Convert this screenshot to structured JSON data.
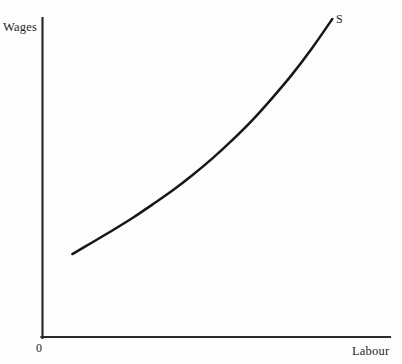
{
  "figure": {
    "background_color": "#fdfdfd",
    "ink_color": "#1a1a1a",
    "axis_color": "#2b2b2b"
  },
  "labels": {
    "y_axis_title": "Wages",
    "x_axis_title": "Labour",
    "origin": "0",
    "curve": "S"
  },
  "chart_data": {
    "type": "line",
    "title": "",
    "subtitle": "",
    "xlabel": "Labour",
    "ylabel": "Wages",
    "annotations": [
      {
        "text": "S",
        "meaning": "labour supply curve",
        "position": "upper-right end of curve"
      },
      {
        "text": "0",
        "meaning": "origin",
        "position": "below intersection of axes"
      }
    ],
    "grid": false,
    "legend": null,
    "axis_ticks": {
      "x": [],
      "y": []
    },
    "axis_arrows": false,
    "xlim": [
      0,
      1
    ],
    "ylim": [
      0,
      1
    ],
    "series": [
      {
        "name": "S",
        "description": "Upward sloping labour supply curve, convex (increasing slope) from left to right",
        "x": [
          0.086,
          0.144,
          0.201,
          0.259,
          0.316,
          0.374,
          0.431,
          0.489,
          0.546,
          0.604,
          0.661,
          0.719,
          0.776,
          0.834
        ],
        "y": [
          0.26,
          0.297,
          0.334,
          0.373,
          0.415,
          0.459,
          0.507,
          0.56,
          0.617,
          0.68,
          0.749,
          0.824,
          0.906,
          0.997
        ]
      }
    ]
  }
}
